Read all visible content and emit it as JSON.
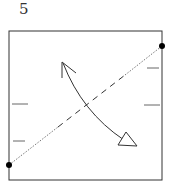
{
  "diagram": {
    "step_number": "5",
    "type": "origami-fold-step",
    "elements": {
      "paper": "square",
      "fold_line": "diagonal valley fold from lower-left corner to upper-right point",
      "reference_points": [
        "lower-left-dot",
        "upper-right-dot"
      ],
      "edge_marks": {
        "left": 2,
        "right": 2
      },
      "arrow": "fold-and-unfold curved arrow"
    },
    "colors": {
      "line": "#333333",
      "dot": "#000000",
      "background": "#ffffff"
    }
  }
}
